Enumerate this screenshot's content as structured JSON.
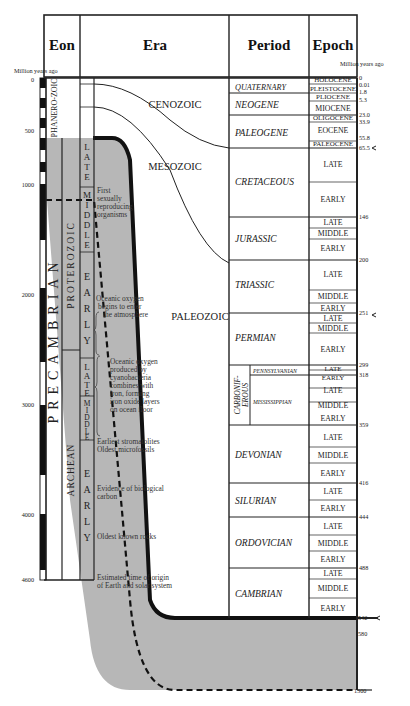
{
  "headers": {
    "eon": "Eon",
    "era": "Era",
    "period": "Period",
    "epoch": "Epoch"
  },
  "axis_label_left": "Million years ago",
  "axis_label_right": "Million years ago",
  "left_ticks": [
    "0",
    "500",
    "1000",
    "2000",
    "3000",
    "4000",
    "4600"
  ],
  "eons": {
    "phanerozoic": "PHANERO-ZOIC",
    "precambrian": "PRECAMBRIAN",
    "proterozoic": "PROTEROZOIC",
    "archean": "ARCHEAN"
  },
  "subdivisions": {
    "late": "LATE",
    "middle": "MIDDLE",
    "early": "EARLY"
  },
  "eras": {
    "cenozoic": "CENOZOIC",
    "mesozoic": "MESOZOIC",
    "paleozoic": "PALEOZOIC"
  },
  "notes": {
    "n1": [
      "First",
      "sexually",
      "reproducing",
      "organisms"
    ],
    "n2": [
      "Oceanic oxygen",
      "begins to enter",
      "the atmosphere"
    ],
    "n3": [
      "Oceanic oxygen",
      "produced by",
      "cyanobacteria",
      "combines with",
      "iron, forming",
      "iron oxide layers",
      "on ocean floor"
    ],
    "n4": [
      "Earliest stromatolites",
      "Oldest microfossils"
    ],
    "n5": [
      "Evidence of biological",
      "carbon"
    ],
    "n6": [
      "Oldest known rocks"
    ],
    "n7": [
      "Estimated time of origin",
      "of Earth and solar system"
    ]
  },
  "periods": {
    "quaternary": "QUATERNARY",
    "neogene": "NEOGENE",
    "paleogene": "PALEOGENE",
    "cretaceous": "CRETACEOUS",
    "jurassic": "JURASSIC",
    "triassic": "TRIASSIC",
    "permian": "PERMIAN",
    "carboniferous_1": "CARBONIF-",
    "carboniferous_2": "EROUS",
    "pennsylvanian": "PENNSYLVANIAN",
    "mississippian": "MISSISSIPPIAN",
    "devonian": "DEVONIAN",
    "silurian": "SILURIAN",
    "ordovician": "ORDOVICIAN",
    "cambrian": "CAMBRIAN"
  },
  "epochs": {
    "holocene": "HOLOCENE",
    "pleistocene": "PLEISTOCENE",
    "pliocene": "PLIOCENE",
    "miocene": "MIOCENE",
    "oligocene": "OLIGOCENE",
    "eocene": "EOCENE",
    "paleocene": "PALEOCENE"
  },
  "right_ticks": [
    "0",
    "0.01",
    "1.8",
    "5.3",
    "23.0",
    "33.9",
    "55.8",
    "65.5",
    "146",
    "200",
    "251",
    "299",
    "318",
    "359",
    "416",
    "444",
    "488",
    "542",
    "580",
    "1300"
  ],
  "colors": {
    "shade": "#b4b4b4",
    "line": "#1a1a1a"
  }
}
